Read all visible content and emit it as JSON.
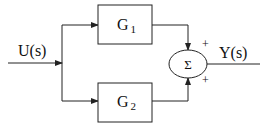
{
  "diagram": {
    "type": "block-diagram",
    "input": {
      "label": "U(s)"
    },
    "output": {
      "label": "Y(s)"
    },
    "blocks": [
      {
        "name": "G",
        "subscript": "1"
      },
      {
        "name": "G",
        "subscript": "2"
      }
    ],
    "summer": {
      "symbol": "Σ",
      "signs": [
        "+",
        "+"
      ]
    },
    "colors": {
      "stroke": "#222222",
      "background": "#ffffff"
    }
  }
}
